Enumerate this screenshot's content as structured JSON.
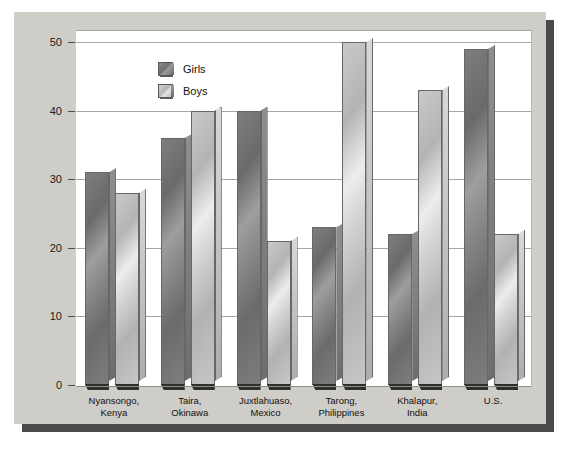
{
  "chart_data": {
    "type": "bar",
    "title": "",
    "xlabel": "",
    "ylabel": "Percentage of Time Spent Playing with Peers",
    "ylim": [
      0,
      50
    ],
    "yticks": [
      0,
      10,
      20,
      30,
      40,
      50
    ],
    "grid": true,
    "legend_position": "top-left",
    "categories": [
      "Nyansongo,\nKenya",
      "Taira,\nOkinawa",
      "Juxtlahuaso,\nMexico",
      "Tarong,\nPhilippines",
      "Khalapur,\nIndia",
      "U.S."
    ],
    "category_lines": [
      [
        "Nyansongo,",
        "Kenya"
      ],
      [
        "Taira,",
        "Okinawa"
      ],
      [
        "Juxtlahuaso,",
        "Mexico"
      ],
      [
        "Tarong,",
        "Philippines"
      ],
      [
        "Khalapur,",
        "India"
      ],
      [
        "U.S.",
        ""
      ]
    ],
    "series": [
      {
        "name": "Girls",
        "color": "#7a7a7a",
        "values": [
          31,
          36,
          40,
          23,
          22,
          49
        ]
      },
      {
        "name": "Boys",
        "color": "#c8c8c8",
        "values": [
          28,
          40,
          21,
          50,
          43,
          22
        ]
      }
    ]
  },
  "legend": {
    "items": [
      {
        "label": "Girls"
      },
      {
        "label": "Boys"
      }
    ]
  },
  "axis": {
    "y_tick_labels": [
      "50",
      "40",
      "30",
      "20",
      "10",
      "0"
    ],
    "y_title": "Percentage of Time Spent Playing with Peers"
  }
}
